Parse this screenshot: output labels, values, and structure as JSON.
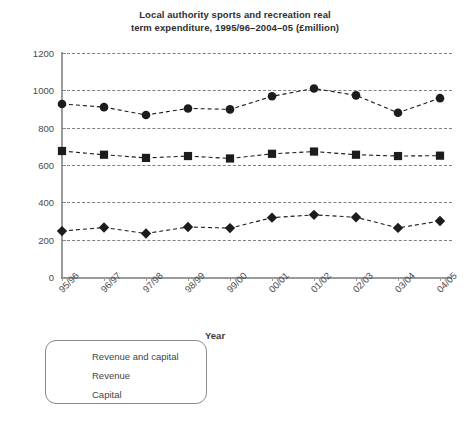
{
  "chart_data": {
    "type": "line",
    "title_line1": "Local authority sports and recreation real",
    "title_line2": "term expenditure, 1995/96–2004–05 (£million)",
    "xlabel": "Year",
    "ylabel": "",
    "categories": [
      "95/96",
      "96/97",
      "97/98",
      "98/99",
      "99/00",
      "00/01",
      "01/02",
      "02/03",
      "03/04",
      "04/05"
    ],
    "ylim": [
      0,
      1200
    ],
    "yticks": [
      0,
      200,
      400,
      600,
      800,
      1000,
      1200
    ],
    "ytick_labels": [
      "0",
      "200",
      "400",
      "600",
      "800",
      "1000",
      "1200"
    ],
    "grid": true,
    "grid_style": "dashed",
    "legend_position": "below-left",
    "line_style": "dashed",
    "series": [
      {
        "name": "Revenue and capital",
        "marker": "circle",
        "color": "#1c1c1c",
        "values": [
          927,
          910,
          868,
          903,
          898,
          968,
          1010,
          973,
          880,
          958
        ]
      },
      {
        "name": "Revenue",
        "marker": "square",
        "color": "#1c1c1c",
        "values": [
          675,
          655,
          638,
          648,
          635,
          660,
          672,
          655,
          648,
          650
        ]
      },
      {
        "name": "Capital",
        "marker": "diamond",
        "color": "#1c1c1c",
        "values": [
          246,
          265,
          233,
          268,
          262,
          318,
          333,
          320,
          263,
          300
        ]
      }
    ]
  },
  "legend": {
    "items": [
      {
        "label": "Revenue and capital",
        "marker": "circle"
      },
      {
        "label": "Revenue",
        "marker": "square"
      },
      {
        "label": "Capital",
        "marker": "diamond"
      }
    ]
  },
  "colors": {
    "marker": "#1c1c1c",
    "gridline": "#7f7f7f",
    "axis": "#9a9a9a",
    "text": "#3a3a3a",
    "background": "#ffffff"
  }
}
